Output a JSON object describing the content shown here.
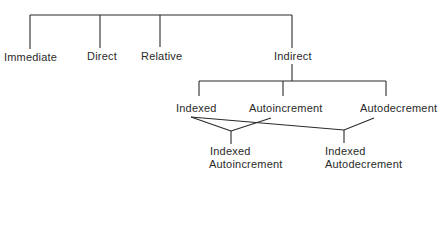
{
  "diagram": {
    "type": "tree",
    "root": {
      "children": [
        {
          "label": "Immediate"
        },
        {
          "label": "Direct"
        },
        {
          "label": "Relative"
        },
        {
          "label": "Indirect",
          "children": [
            {
              "label": "Indexed"
            },
            {
              "label": "Autoincrement"
            },
            {
              "label": "Autodecrement"
            }
          ]
        }
      ]
    },
    "combined": [
      {
        "line1": "Indexed",
        "line2": "Autoincrement",
        "from": [
          "Indexed",
          "Autoincrement"
        ]
      },
      {
        "line1": "Indexed",
        "line2": "Autodecrement",
        "from": [
          "Indexed",
          "Autodecrement"
        ]
      }
    ],
    "line_color": "#2a2a2a"
  }
}
